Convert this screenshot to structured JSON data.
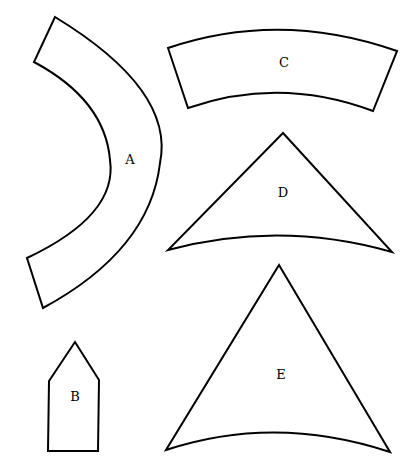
{
  "diagram": {
    "title": "",
    "shapes": [
      {
        "id": "A",
        "label": "A",
        "type": "curved-band (annular sector)"
      },
      {
        "id": "B",
        "label": "B",
        "type": "pentagon (house shape)"
      },
      {
        "id": "C",
        "label": "C",
        "type": "curved-band (annular sector)"
      },
      {
        "id": "D",
        "label": "D",
        "type": "triangle with concave curved base"
      },
      {
        "id": "E",
        "label": "E",
        "type": "triangle with concave curved base"
      }
    ]
  },
  "colors": {
    "stroke": "#000000",
    "fill": "#ffffff"
  }
}
